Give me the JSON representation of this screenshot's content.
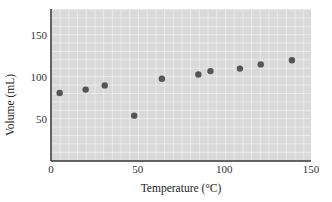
{
  "chart_data": {
    "type": "scatter",
    "title": "",
    "xlabel": "Temperature (°C)",
    "ylabel": "Volume (mL)",
    "xlim": [
      0,
      150
    ],
    "ylim": [
      0,
      180
    ],
    "xticks": [
      0,
      50,
      100,
      150
    ],
    "yticks": [
      50,
      100,
      150
    ],
    "grid": true,
    "legend": null,
    "series": [
      {
        "name": "data",
        "x": [
          5,
          20,
          31,
          48,
          64,
          85,
          92,
          109,
          121,
          139
        ],
        "y": [
          81,
          85,
          90,
          54,
          98,
          103,
          107,
          110,
          115,
          120
        ]
      }
    ],
    "colors": {
      "plot_background": "#d9d9d9",
      "grid_lines": "#f4f4f4",
      "axis": "#333333",
      "points": "#555555"
    }
  }
}
